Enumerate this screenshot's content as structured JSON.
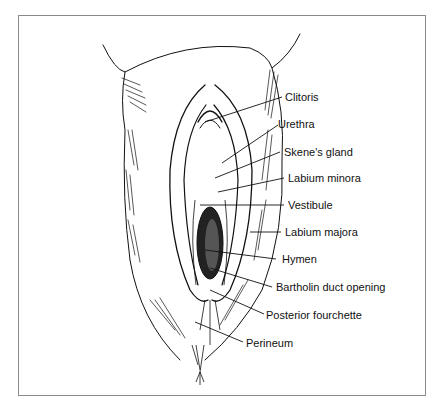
{
  "diagram": {
    "type": "labeled anatomical line illustration",
    "labels": [
      {
        "id": "clitoris",
        "text": "Clitoris"
      },
      {
        "id": "urethra",
        "text": "Urethra"
      },
      {
        "id": "skenes-gland",
        "text": "Skene's gland"
      },
      {
        "id": "labium-minora",
        "text": "Labium minora"
      },
      {
        "id": "vestibule",
        "text": "Vestibule"
      },
      {
        "id": "labium-majora",
        "text": "Labium majora"
      },
      {
        "id": "hymen",
        "text": "Hymen"
      },
      {
        "id": "bartholin-duct-opening",
        "text": "Bartholin duct opening"
      },
      {
        "id": "posterior-fourchette",
        "text": "Posterior fourchette"
      },
      {
        "id": "perineum",
        "text": "Perineum"
      }
    ],
    "colors": {
      "line": "#111111",
      "frame": "#8a8a8a",
      "background": "#ffffff"
    }
  }
}
